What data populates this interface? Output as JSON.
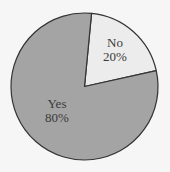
{
  "chart_data": {
    "type": "pie",
    "title": "",
    "categories": [
      "No",
      "Yes"
    ],
    "values": [
      20,
      80
    ],
    "labels": [
      {
        "name": "No",
        "percent": "20%"
      },
      {
        "name": "Yes",
        "percent": "80%"
      }
    ],
    "colors": [
      "#ececec",
      "#a4a4a4"
    ],
    "start_angle_deg": 5.5,
    "direction": "clockwise",
    "legend": "none",
    "outline_color": "#333333"
  },
  "background": "#f6f6f6",
  "geometry": {
    "cx": 84.5,
    "cy": 86.5,
    "r": 73.5
  }
}
